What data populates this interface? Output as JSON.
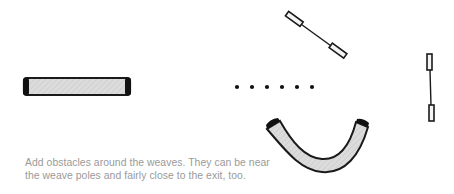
{
  "diagram": {
    "background_color": "#ffffff",
    "stroke_color": "#1a1a1a",
    "tunnel_fill_color": "#d9d9d9",
    "obstacles": [
      {
        "type": "straight-tunnel",
        "label": "Straight tunnel"
      },
      {
        "type": "weave-poles",
        "label": "Weave poles",
        "count": 6
      },
      {
        "type": "diagonal-jump",
        "label": "Angled bar jump"
      },
      {
        "type": "vertical-jump",
        "label": "Vertical bar jump"
      },
      {
        "type": "curved-tunnel",
        "label": "Curved tunnel"
      }
    ]
  },
  "caption": {
    "line1": "Add obstacles around the weaves. They can be near",
    "line2": "the weave poles and fairly close to the exit, too.",
    "color": "#9a9a9a"
  }
}
